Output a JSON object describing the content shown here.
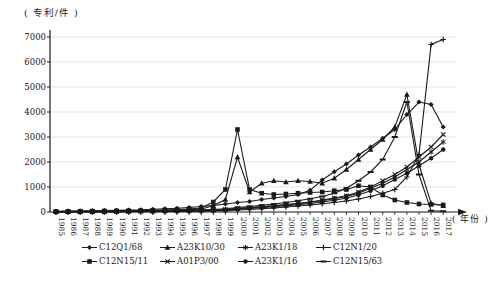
{
  "chart": {
    "unit_label": "( 专利/件 )",
    "year_label": "( 年份 )",
    "y_ticks": [
      0,
      1000,
      2000,
      3000,
      4000,
      5000,
      6000,
      7000
    ]
  },
  "chart_data": {
    "type": "line",
    "title": "",
    "xlabel": "年份",
    "ylabel": "专利/件",
    "ylim": [
      0,
      7000
    ],
    "grid": true,
    "legend_position": "bottom",
    "line_color": "#1a1a1a",
    "grid_color": "#d9d9d9",
    "x": [
      1985,
      1986,
      1987,
      1988,
      1989,
      1990,
      1991,
      1992,
      1993,
      1994,
      1995,
      1996,
      1997,
      1998,
      1999,
      2000,
      2001,
      2002,
      2003,
      2004,
      2005,
      2006,
      2007,
      2008,
      2009,
      2010,
      2011,
      2012,
      2013,
      2014,
      2015,
      2016,
      2017
    ],
    "series": [
      {
        "name": "C12Q1/68",
        "marker": "diamond",
        "values": [
          30,
          35,
          40,
          50,
          60,
          70,
          80,
          90,
          110,
          130,
          150,
          180,
          220,
          260,
          320,
          380,
          420,
          500,
          560,
          620,
          700,
          870,
          1280,
          1610,
          1920,
          2280,
          2600,
          2950,
          3300,
          3900,
          4400,
          4300,
          3400
        ]
      },
      {
        "name": "C12N15/11",
        "marker": "square",
        "values": [
          20,
          25,
          30,
          35,
          40,
          45,
          50,
          60,
          70,
          80,
          100,
          120,
          160,
          400,
          900,
          3300,
          900,
          750,
          700,
          720,
          750,
          780,
          800,
          850,
          900,
          1050,
          1000,
          680,
          480,
          380,
          320,
          300,
          280
        ]
      },
      {
        "name": "A23K10/30",
        "marker": "triangle",
        "values": [
          15,
          18,
          22,
          26,
          30,
          35,
          40,
          48,
          55,
          65,
          80,
          95,
          120,
          250,
          500,
          2200,
          800,
          1150,
          1250,
          1200,
          1250,
          1220,
          1150,
          1350,
          1700,
          2100,
          2500,
          2900,
          3400,
          4700,
          1900,
          350,
          250
        ]
      },
      {
        "name": "A01P3/00",
        "marker": "x",
        "values": [
          10,
          12,
          14,
          16,
          18,
          20,
          25,
          30,
          35,
          40,
          50,
          60,
          70,
          85,
          100,
          150,
          180,
          220,
          260,
          300,
          350,
          400,
          480,
          560,
          650,
          800,
          1000,
          1250,
          1500,
          1800,
          2200,
          2600,
          3100
        ]
      },
      {
        "name": "A23K1/18",
        "marker": "star",
        "values": [
          8,
          10,
          12,
          14,
          16,
          18,
          22,
          26,
          30,
          36,
          44,
          52,
          62,
          75,
          90,
          130,
          160,
          200,
          240,
          280,
          330,
          380,
          450,
          530,
          620,
          750,
          950,
          1150,
          1400,
          1700,
          2000,
          2400,
          2800
        ]
      },
      {
        "name": "A23K1/16",
        "marker": "circle",
        "values": [
          5,
          6,
          8,
          10,
          12,
          14,
          16,
          20,
          24,
          28,
          34,
          40,
          50,
          60,
          75,
          110,
          140,
          170,
          210,
          250,
          290,
          340,
          400,
          470,
          560,
          680,
          850,
          1050,
          1300,
          1550,
          1850,
          2150,
          2500
        ]
      },
      {
        "name": "C12N1/20",
        "marker": "plus",
        "values": [
          5,
          6,
          7,
          8,
          10,
          12,
          14,
          16,
          18,
          22,
          26,
          30,
          36,
          44,
          54,
          80,
          100,
          130,
          160,
          200,
          240,
          280,
          330,
          380,
          440,
          520,
          620,
          750,
          900,
          1400,
          2300,
          6700,
          6900
        ]
      },
      {
        "name": "C12N15/63",
        "marker": "dash",
        "values": [
          10,
          12,
          15,
          18,
          20,
          24,
          28,
          32,
          38,
          45,
          55,
          65,
          80,
          100,
          130,
          180,
          220,
          270,
          320,
          380,
          450,
          530,
          620,
          750,
          950,
          1250,
          1600,
          2100,
          3000,
          4400,
          1500,
          50,
          30
        ]
      }
    ]
  }
}
